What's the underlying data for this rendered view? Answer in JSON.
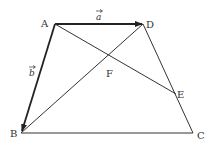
{
  "diagram": {
    "type": "geometry-trapezoid",
    "points": {
      "A": {
        "label": "A",
        "x": 55,
        "y": 24
      },
      "D": {
        "label": "D",
        "x": 143,
        "y": 24
      },
      "B": {
        "label": "B",
        "x": 21,
        "y": 133
      },
      "C": {
        "label": "C",
        "x": 193,
        "y": 133
      },
      "E": {
        "label": "E",
        "x": 176,
        "y": 94
      },
      "F": {
        "label": "F",
        "x": 108,
        "y": 65
      }
    },
    "vectors": {
      "a": {
        "label": "a",
        "from": "A",
        "to": "D"
      },
      "b": {
        "label": "b",
        "from": "A",
        "to": "B"
      }
    },
    "segments": [
      "A-D",
      "A-B",
      "B-C",
      "D-C",
      "A-E",
      "B-D"
    ],
    "colors": {
      "line": "#333333",
      "background": "#ffffff"
    }
  }
}
